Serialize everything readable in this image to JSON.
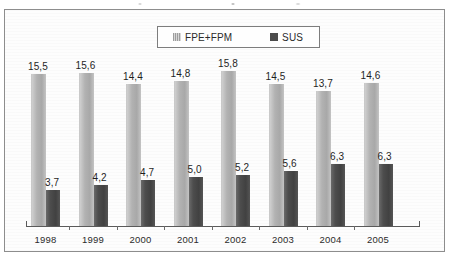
{
  "chart_data": {
    "type": "bar",
    "title": "",
    "subtitle": "",
    "xlabel": "",
    "ylabel": "",
    "ylim": [
      0,
      17.5
    ],
    "grid": false,
    "legend_position": "top-center",
    "decimal_separator": ",",
    "categories": [
      "1998",
      "1999",
      "2000",
      "2001",
      "2002",
      "2003",
      "2004",
      "2005"
    ],
    "series": [
      {
        "name": "FPE+FPM",
        "color": "#b2b2b2",
        "values": [
          15.5,
          15.6,
          14.4,
          14.8,
          15.8,
          14.5,
          13.7,
          14.6
        ],
        "labels": [
          "15,5",
          "15,6",
          "14,4",
          "14,8",
          "15,8",
          "14,5",
          "13,7",
          "14,6"
        ]
      },
      {
        "name": "SUS",
        "color": "#4b4b4b",
        "values": [
          3.7,
          4.2,
          4.7,
          5.0,
          5.2,
          5.6,
          6.3,
          6.3
        ],
        "labels": [
          "3,7",
          "4,2",
          "4,7",
          "5,0",
          "5,2",
          "5,6",
          "6,3",
          "6,3"
        ]
      }
    ]
  },
  "legend": {
    "items": [
      {
        "label": "FPE+FPM",
        "swatch": "striped-light-gray-swatch"
      },
      {
        "label": "SUS",
        "swatch": "solid-dark-gray-swatch"
      }
    ]
  }
}
